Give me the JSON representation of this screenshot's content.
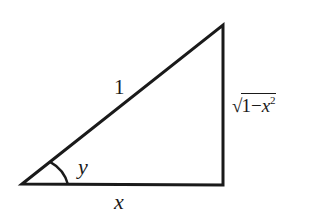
{
  "diagram": {
    "type": "right-triangle",
    "stroke_color": "#1a1a1a",
    "background": "#ffffff",
    "vertices": {
      "bottom_left": [
        22,
        184
      ],
      "top_right": [
        223,
        25
      ],
      "bottom_right": [
        223,
        185
      ]
    },
    "labels": {
      "hypotenuse": "1",
      "opposite_radical_sign": "√",
      "opposite_radicand_base": "1−",
      "opposite_radicand_var": "x",
      "opposite_radicand_exp": "2",
      "angle": "y",
      "adjacent": "x"
    },
    "angle_marker": {
      "vertex": "bottom_left",
      "radius": 45
    }
  }
}
